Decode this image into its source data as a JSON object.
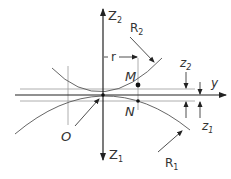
{
  "diagram": {
    "type": "contact-geometry",
    "labels": {
      "z2_axis": "Z",
      "z2_axis_sub": "2",
      "z1_axis": "Z",
      "z1_axis_sub": "1",
      "y_axis": "y",
      "radius_upper": "R",
      "radius_upper_sub": "2",
      "radius_lower": "R",
      "radius_lower_sub": "1",
      "r_dim": "r",
      "point_m": "M",
      "point_n": "N",
      "origin": "O",
      "z2_dim": "z",
      "z2_dim_sub": "2",
      "z1_dim": "z",
      "z1_dim_sub": "1"
    },
    "colors": {
      "line": "#333333",
      "thin": "#888888",
      "background": "#ffffff"
    }
  }
}
